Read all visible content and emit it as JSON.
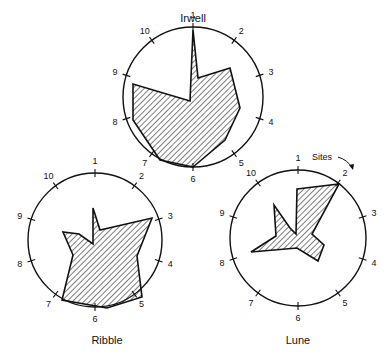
{
  "figure": {
    "annotation": "Sites",
    "diagrams": [
      {
        "name": "Irwell",
        "cx": 193,
        "cy": 97,
        "r": 70,
        "title_x": 193,
        "title_y": 22,
        "sites": [
          "1",
          "2",
          "3",
          "4",
          "5",
          "6",
          "7",
          "8",
          "9",
          "10"
        ],
        "values": [
          0.97,
          0.0,
          0.6,
          0.82,
          1.0,
          1.0,
          1.0,
          1.0,
          0.97,
          0.0
        ],
        "polygon": [
          [
            193,
            30
          ],
          [
            198,
            78
          ],
          [
            230,
            68
          ],
          [
            240,
            108
          ],
          [
            225,
            140
          ],
          [
            193,
            167
          ],
          [
            160,
            160
          ],
          [
            133,
            120
          ],
          [
            133,
            84
          ],
          [
            190,
            101
          ]
        ]
      },
      {
        "name": "Ribble",
        "cx": 95,
        "cy": 240,
        "r": 67,
        "title_x": 107,
        "title_y": 344,
        "sites": [
          "1",
          "2",
          "3",
          "4",
          "5",
          "6",
          "7",
          "8",
          "9",
          "10"
        ],
        "values": [
          0.35,
          0.1,
          0.95,
          0.6,
          0.97,
          1.0,
          1.0,
          0.4,
          0.5,
          0.2
        ],
        "polygon": [
          [
            93,
            208
          ],
          [
            100,
            230
          ],
          [
            152,
            218
          ],
          [
            137,
            256
          ],
          [
            142,
            297
          ],
          [
            107,
            308
          ],
          [
            62,
            300
          ],
          [
            73,
            255
          ],
          [
            63,
            232
          ],
          [
            79,
            234
          ],
          [
            93,
            244
          ]
        ]
      },
      {
        "name": "Lune",
        "cx": 298,
        "cy": 238,
        "r": 68,
        "title_x": 298,
        "title_y": 344,
        "sites": [
          "1",
          "2",
          "3",
          "4",
          "5",
          "6",
          "7",
          "8",
          "9",
          "10"
        ],
        "values": [
          0.0,
          1.0,
          0.45,
          0.55,
          0.0,
          0.0,
          0.0,
          0.78,
          0.65,
          0.0
        ],
        "polygon": [
          [
            297,
            189
          ],
          [
            339,
            184
          ],
          [
            312,
            234
          ],
          [
            324,
            245
          ],
          [
            318,
            261
          ],
          [
            297,
            248
          ],
          [
            251,
            252
          ],
          [
            276,
            236
          ],
          [
            274,
            205
          ],
          [
            290,
            228
          ],
          [
            296,
            234
          ]
        ]
      }
    ]
  }
}
